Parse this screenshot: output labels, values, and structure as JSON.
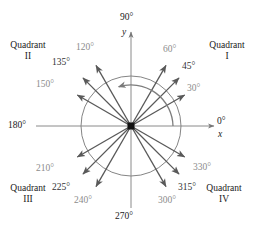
{
  "figure": {
    "center": {
      "x": 131,
      "y": 126
    },
    "circle_radius": 50,
    "colors": {
      "gray_label": "#8c8c8c",
      "dark_label": "#333333",
      "axis": "#888888",
      "ray": "#595959",
      "circle": "#808080",
      "background": "#ffffff"
    },
    "axes": {
      "x_axis_label": "x",
      "y_axis_label": "y",
      "zero_label": "0°",
      "ninety_label": "90°",
      "one_eighty_label": "180°",
      "two_seventy_label": "270°"
    },
    "quadrants": [
      {
        "name": "Quadrant",
        "numeral": "I",
        "x": 205,
        "y": 42
      },
      {
        "name": "Quadrant",
        "numeral": "II",
        "x": 10,
        "y": 42
      },
      {
        "name": "Quadrant",
        "numeral": "III",
        "x": 10,
        "y": 185
      },
      {
        "name": "Quadrant",
        "numeral": "IV",
        "x": 200,
        "y": 185
      }
    ],
    "rays": [
      {
        "label": "30°",
        "angle": 30,
        "emphasis": "gray",
        "lx": 187,
        "ly": 84,
        "ray_len": 62
      },
      {
        "label": "45°",
        "angle": 45,
        "emphasis": "dark",
        "lx": 182,
        "ly": 62,
        "ray_len": 68
      },
      {
        "label": "60°",
        "angle": 60,
        "emphasis": "gray",
        "lx": 163,
        "ly": 45,
        "ray_len": 70
      },
      {
        "label": "120°",
        "angle": 120,
        "emphasis": "gray",
        "lx": 79,
        "ly": 43,
        "ray_len": 70
      },
      {
        "label": "135°",
        "angle": 135,
        "emphasis": "dark",
        "lx": 58,
        "ly": 58,
        "ray_len": 68
      },
      {
        "label": "150°",
        "angle": 150,
        "emphasis": "gray",
        "lx": 42,
        "ly": 80,
        "ray_len": 62
      },
      {
        "label": "210°",
        "angle": 210,
        "emphasis": "gray",
        "lx": 42,
        "ly": 167,
        "ray_len": 62
      },
      {
        "label": "225°",
        "angle": 225,
        "emphasis": "dark",
        "lx": 57,
        "ly": 186,
        "ray_len": 68
      },
      {
        "label": "240°",
        "angle": 240,
        "emphasis": "gray",
        "lx": 77,
        "ly": 199,
        "ray_len": 70
      },
      {
        "label": "300°",
        "angle": 300,
        "emphasis": "gray",
        "lx": 160,
        "ly": 199,
        "ray_len": 70
      },
      {
        "label": "315°",
        "angle": 315,
        "emphasis": "dark",
        "lx": 180,
        "ly": 186,
        "ray_len": 68
      },
      {
        "label": "330°",
        "angle": 330,
        "emphasis": "gray",
        "lx": 196,
        "ly": 166,
        "ray_len": 62
      }
    ],
    "sweep_arc": {
      "name": "counterclockwise-rotation-arc",
      "start_angle": 0,
      "end_angle": 107,
      "radius": 42,
      "direction": "counterclockwise"
    }
  }
}
